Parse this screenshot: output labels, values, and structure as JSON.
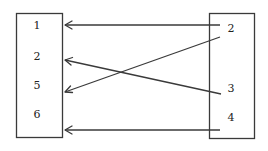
{
  "diagram": {
    "type": "mapping",
    "left_set": {
      "items": [
        "1",
        "2",
        "5",
        "6"
      ]
    },
    "right_set": {
      "items": [
        "2",
        "3",
        "4"
      ]
    },
    "mappings": [
      {
        "from": "2",
        "to": "1"
      },
      {
        "from": "3",
        "to": "2"
      },
      {
        "from": "2",
        "to": "5"
      },
      {
        "from": "4",
        "to": "6"
      }
    ],
    "colors": {
      "stroke": "#3a3a3a",
      "text": "#222222",
      "background": "#ffffff"
    }
  }
}
